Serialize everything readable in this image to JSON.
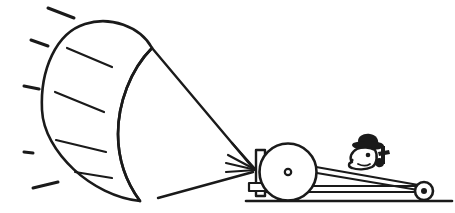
{
  "document": {
    "title": "Kite-powered land vehicle",
    "style": "black-and-white line drawing",
    "background_color": "#ffffff",
    "ink_color": "#1a1a1a",
    "canvas": {
      "width": 455,
      "height": 213
    }
  },
  "scene": {
    "caption": "A crescent-shaped traction kite tethered by two lines to a winch drum mounted on a wheeled buggy steered by a seated figure wearing a hat.",
    "elements": [
      "kite-sail",
      "kite-seam-lines",
      "wind-dashes",
      "tether-upper",
      "tether-lower",
      "tether-fan",
      "winch-drum",
      "buggy-chassis",
      "rear-wheel",
      "driver-figure",
      "ground-line"
    ]
  },
  "kite": {
    "name": "traction-kite-sail",
    "shape": "crescent parafoil",
    "outline_path": "M 152 48 C 140 26 110 16 85 24 C 56 33 40 70 42 110 C 44 152 92 196 140 201 C 126 182 118 160 118 134 C 118 104 130 70 152 48 Z",
    "inner_edge_path": "M 152 48 C 130 70 118 104 118 134 C 118 160 126 182 140 201",
    "seam_lines": [
      {
        "x1": 67,
        "y1": 48,
        "x2": 112,
        "y2": 67
      },
      {
        "x1": 55,
        "y1": 92,
        "x2": 104,
        "y2": 112
      },
      {
        "x1": 56,
        "y1": 140,
        "x2": 106,
        "y2": 152
      },
      {
        "x1": 75,
        "y1": 172,
        "x2": 112,
        "y2": 178
      }
    ],
    "seam_count": 4
  },
  "wind": {
    "name": "wind-dashes",
    "description": "short motion dashes indicating airflow on the windward side",
    "dashes": [
      {
        "x1": 48,
        "y1": 8,
        "x2": 74,
        "y2": 18
      },
      {
        "x1": 31,
        "y1": 40,
        "x2": 48,
        "y2": 46
      },
      {
        "x1": 24,
        "y1": 86,
        "x2": 39,
        "y2": 89
      },
      {
        "x1": 24,
        "y1": 152,
        "x2": 33,
        "y2": 153
      },
      {
        "x1": 33,
        "y1": 188,
        "x2": 58,
        "y2": 182
      }
    ],
    "dash_count": 5
  },
  "tethers": {
    "name": "kite-tether-lines",
    "upper": {
      "x1": 152,
      "y1": 48,
      "x2": 253,
      "y2": 168
    },
    "lower": {
      "x1": 158,
      "y1": 198,
      "x2": 253,
      "y2": 172
    },
    "fan_lines": [
      {
        "x1": 232,
        "y1": 143,
        "x2": 256,
        "y2": 170
      },
      {
        "x1": 228,
        "y1": 155,
        "x2": 256,
        "y2": 170
      },
      {
        "x1": 226,
        "y1": 163,
        "x2": 256,
        "y2": 170
      },
      {
        "x1": 226,
        "y1": 172,
        "x2": 256,
        "y2": 170
      }
    ],
    "attachment_point": {
      "x": 256,
      "y": 170
    }
  },
  "drum": {
    "name": "winch-drum",
    "center": {
      "x": 288,
      "y": 172
    },
    "radius": 28.5,
    "hub_radius": 3.2,
    "bracket": {
      "x": 256,
      "y": 151,
      "width": 8,
      "height": 45
    },
    "block": {
      "x": 250,
      "y": 184,
      "width": 18,
      "height": 8
    }
  },
  "chassis": {
    "name": "buggy-chassis",
    "upper_beam": {
      "x1": 300,
      "y1": 166,
      "x2": 425,
      "y2": 189
    },
    "upper_beam2": {
      "x1": 300,
      "y1": 170,
      "x2": 425,
      "y2": 193
    },
    "lower_beam": {
      "x1": 264,
      "y1": 189,
      "x2": 420,
      "y2": 189
    },
    "lower_beam2": {
      "x1": 264,
      "y1": 193,
      "x2": 420,
      "y2": 193
    },
    "ground_line": {
      "x1": 246,
      "y1": 201,
      "x2": 452,
      "y2": 201
    }
  },
  "rear_wheel": {
    "name": "rear-wheel",
    "center": {
      "x": 424,
      "y": 191
    },
    "radius": 9,
    "hub_radius": 3
  },
  "driver": {
    "name": "driver-figure",
    "description": "cartoon head in profile wearing a brimmed hat, with one hand on a control lever",
    "head_center": {
      "x": 366,
      "y": 155
    },
    "hat": "brimmed-bowler-hat",
    "facing": "left",
    "lever": {
      "x1": 382,
      "y1": 148,
      "x2": 380,
      "y2": 165
    }
  }
}
